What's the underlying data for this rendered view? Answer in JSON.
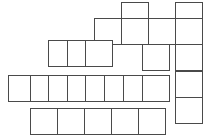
{
  "puzzle": {
    "title": "Crossword Grid",
    "type": "blank-crossword-skeleton",
    "canvas": {
      "width": 203,
      "height": 139,
      "background": "#ffffff"
    },
    "cell": {
      "width": 28,
      "height": 27,
      "border_color": "#4a4a4a",
      "fill_color": "#ffffff",
      "border_width": 1
    },
    "grid": {
      "origin_x": 8,
      "origin_y": 2,
      "col_step": 27,
      "row_step": 26,
      "columns": 8,
      "rows": 5
    },
    "cells": [
      {
        "id": "c-r0-c4",
        "row": 0,
        "col": 4,
        "x": 121,
        "y": 2,
        "label": ""
      },
      {
        "id": "c-r0-c6",
        "row": 0,
        "col": 6,
        "x": 175,
        "y": 2,
        "label": ""
      },
      {
        "id": "c-r1-c3",
        "row": 1,
        "col": 3,
        "x": 94,
        "y": 18,
        "label": ""
      },
      {
        "id": "c-r1-c4",
        "row": 1,
        "col": 4,
        "x": 121,
        "y": 18,
        "label": ""
      },
      {
        "id": "c-r1-c5",
        "row": 1,
        "col": 5,
        "x": 148,
        "y": 18,
        "label": ""
      },
      {
        "id": "c-r1-c6",
        "row": 1,
        "col": 6,
        "x": 175,
        "y": 18,
        "label": ""
      },
      {
        "id": "c-r2-c1",
        "row": 2,
        "col": 1,
        "x": 48,
        "y": 40,
        "label": ""
      },
      {
        "id": "c-r2-c2",
        "row": 2,
        "col": 2,
        "x": 67,
        "y": 40,
        "label": ""
      },
      {
        "id": "c-r2-c3",
        "row": 2,
        "col": 3,
        "x": 85,
        "y": 40,
        "label": ""
      },
      {
        "id": "c-r2-c4",
        "row": 2,
        "col": 4,
        "x": 142,
        "y": 44,
        "label": ""
      },
      {
        "id": "c-r2-c6",
        "row": 2,
        "col": 6,
        "x": 175,
        "y": 44,
        "label": ""
      },
      {
        "id": "c-r3-c0",
        "row": 3,
        "col": 0,
        "x": 8,
        "y": 75,
        "label": ""
      },
      {
        "id": "c-r3-c1",
        "row": 3,
        "col": 1,
        "x": 30,
        "y": 75,
        "label": ""
      },
      {
        "id": "c-r3-c2",
        "row": 3,
        "col": 2,
        "x": 48,
        "y": 75,
        "label": ""
      },
      {
        "id": "c-r3-c3",
        "row": 3,
        "col": 3,
        "x": 67,
        "y": 75,
        "label": ""
      },
      {
        "id": "c-r3-c4",
        "row": 3,
        "col": 4,
        "x": 85,
        "y": 75,
        "label": ""
      },
      {
        "id": "c-r3-c5",
        "row": 3,
        "col": 5,
        "x": 104,
        "y": 75,
        "label": ""
      },
      {
        "id": "c-r3-c6",
        "row": 3,
        "col": 6,
        "x": 123,
        "y": 75,
        "label": ""
      },
      {
        "id": "c-r3-c7",
        "row": 3,
        "col": 7,
        "x": 142,
        "y": 75,
        "label": ""
      },
      {
        "id": "c-r3-c8",
        "row": 3,
        "col": 8,
        "x": 175,
        "y": 71,
        "label": ""
      },
      {
        "id": "c-r4-c6",
        "row": 4,
        "col": 6,
        "x": 175,
        "y": 97,
        "label": ""
      },
      {
        "id": "c-r5-c1",
        "row": 5,
        "col": 1,
        "x": 30,
        "y": 108,
        "label": ""
      },
      {
        "id": "c-r5-c2",
        "row": 5,
        "col": 2,
        "x": 57,
        "y": 108,
        "label": ""
      },
      {
        "id": "c-r5-c3",
        "row": 5,
        "col": 3,
        "x": 84,
        "y": 108,
        "label": ""
      },
      {
        "id": "c-r5-c4",
        "row": 5,
        "col": 4,
        "x": 111,
        "y": 108,
        "label": ""
      },
      {
        "id": "c-r5-c5",
        "row": 5,
        "col": 5,
        "x": 138,
        "y": 108,
        "label": ""
      }
    ]
  }
}
